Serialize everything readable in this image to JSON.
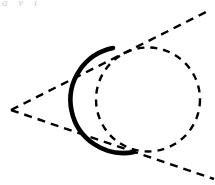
{
  "figure": {
    "background_color": "#ffffff",
    "stroke_color": "#000000",
    "width": 215,
    "height": 185,
    "cropped_caption_text": "g y j"
  },
  "geometry": {
    "circle": {
      "name": "tangent-circle",
      "center_x": 148,
      "center_y": 99.5,
      "radius": 52,
      "dash_pattern": "7,6",
      "dash_stroke_width": 2.4
    },
    "external_point": {
      "name": "apex-vertex",
      "x": 11,
      "y": 110
    },
    "upper_tangent": {
      "name": "upper-tangent-line",
      "x1": 11,
      "y1": 110,
      "x2": 208,
      "y2": 11,
      "dash_pattern": "8,6",
      "stroke_width": 2.4
    },
    "lower_tangent": {
      "name": "lower-tangent-line",
      "x1": 11,
      "y1": 110,
      "x2": 214,
      "y2": 179,
      "dash_pattern": "8,6",
      "stroke_width": 2.4
    },
    "solid_arc": {
      "name": "near-solid-arc",
      "start_x": 113,
      "start_y": 48,
      "end_x": 134,
      "end_y": 152,
      "radius": 52,
      "large_arc": 0,
      "sweep": 0,
      "stroke_width": 4.6
    }
  }
}
